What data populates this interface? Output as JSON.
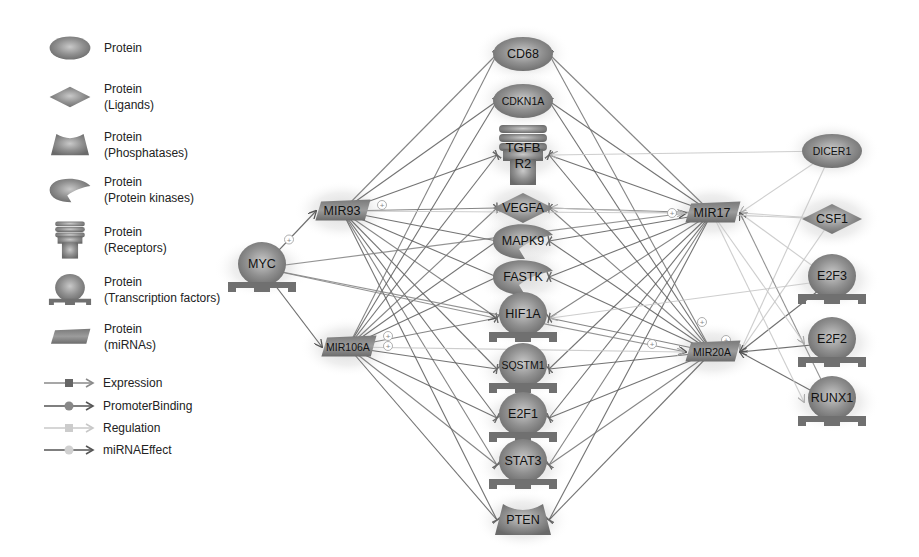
{
  "legend": {
    "node_types": [
      {
        "shape": "ellipse",
        "label_line1": "Protein",
        "label_line2": ""
      },
      {
        "shape": "diamond",
        "label_line1": "Protein",
        "label_line2": "(Ligands)"
      },
      {
        "shape": "phosphatase",
        "label_line1": "Protein",
        "label_line2": "(Phosphatases)"
      },
      {
        "shape": "kinase",
        "label_line1": "Protein",
        "label_line2": "(Protein kinases)"
      },
      {
        "shape": "receptor",
        "label_line1": "Protein",
        "label_line2": "(Receptors)"
      },
      {
        "shape": "tf",
        "label_line1": "Protein",
        "label_line2": "(Transcription factors)"
      },
      {
        "shape": "mirna",
        "label_line1": "Protein",
        "label_line2": "(miRNAs)"
      }
    ],
    "edge_types": [
      {
        "label": "Expression",
        "color": "#8a8a8a",
        "marker": "square",
        "marker_color": "#666666"
      },
      {
        "label": "PromoterBinding",
        "color": "#555555",
        "marker": "circle",
        "marker_color": "#888888"
      },
      {
        "label": "Regulation",
        "color": "#c8c8c8",
        "marker": "square",
        "marker_color": "#cccccc"
      },
      {
        "label": "miRNAEffect",
        "color": "#555555",
        "marker": "circle",
        "marker_color": "#d0d0d0"
      }
    ]
  },
  "nodes": [
    {
      "id": "CD68",
      "label": "CD68",
      "shape": "ellipse",
      "x": 523,
      "y": 54
    },
    {
      "id": "CDKN1A",
      "label": "CDKN1A",
      "shape": "ellipse",
      "x": 523,
      "y": 101
    },
    {
      "id": "TGFBR2",
      "label": "TGFB",
      "label2": "R2",
      "shape": "receptor",
      "x": 523,
      "y": 155
    },
    {
      "id": "VEGFA",
      "label": "VEGFA",
      "shape": "diamond",
      "x": 523,
      "y": 208
    },
    {
      "id": "MAPK9",
      "label": "MAPK9",
      "shape": "kinase",
      "x": 523,
      "y": 241
    },
    {
      "id": "FASTK",
      "label": "FASTK",
      "shape": "kinase",
      "x": 523,
      "y": 277
    },
    {
      "id": "HIF1A",
      "label": "HIF1A",
      "shape": "tf",
      "x": 523,
      "y": 318
    },
    {
      "id": "SQSTM1",
      "label": "SQSTM1",
      "shape": "tf",
      "x": 523,
      "y": 369
    },
    {
      "id": "E2F1",
      "label": "E2F1",
      "shape": "tf",
      "x": 523,
      "y": 418
    },
    {
      "id": "STAT3",
      "label": "STAT3",
      "shape": "tf",
      "x": 523,
      "y": 465
    },
    {
      "id": "PTEN",
      "label": "PTEN",
      "shape": "phosphatase",
      "x": 523,
      "y": 520
    },
    {
      "id": "MYC",
      "label": "MYC",
      "shape": "tf",
      "x": 262,
      "y": 268
    },
    {
      "id": "MIR93",
      "label": "MIR93",
      "shape": "mirna",
      "x": 342,
      "y": 211
    },
    {
      "id": "MIR106A",
      "label": "MIR106A",
      "shape": "mirna",
      "x": 348,
      "y": 347
    },
    {
      "id": "MIR17",
      "label": "MIR17",
      "shape": "mirna",
      "x": 712,
      "y": 213
    },
    {
      "id": "MIR20A",
      "label": "MIR20A",
      "shape": "mirna",
      "x": 712,
      "y": 352
    },
    {
      "id": "DICER1",
      "label": "DICER1",
      "shape": "ellipse",
      "x": 832,
      "y": 151
    },
    {
      "id": "CSF1",
      "label": "CSF1",
      "shape": "diamond",
      "x": 832,
      "y": 219
    },
    {
      "id": "E2F3",
      "label": "E2F3",
      "shape": "tf",
      "x": 832,
      "y": 280
    },
    {
      "id": "E2F2",
      "label": "E2F2",
      "shape": "tf",
      "x": 832,
      "y": 343
    },
    {
      "id": "RUNX1",
      "label": "RUNX1",
      "shape": "tf",
      "x": 832,
      "y": 402
    }
  ],
  "edges": {
    "mirna_targets_sources": [
      "MIR93",
      "MIR106A",
      "MIR17",
      "MIR20A"
    ],
    "mirna_targets": [
      "CD68",
      "CDKN1A",
      "TGFBR2",
      "VEGFA",
      "MAPK9",
      "FASTK",
      "HIF1A",
      "SQSTM1",
      "E2F1",
      "STAT3",
      "PTEN"
    ],
    "myc_edges": [
      {
        "from": "MYC",
        "to": "MIR93",
        "type": "PromoterBinding",
        "plus": true
      },
      {
        "from": "MYC",
        "to": "MIR106A",
        "type": "PromoterBinding",
        "plus": false
      },
      {
        "from": "MYC",
        "to": "MIR17",
        "type": "Expression",
        "plus": false
      },
      {
        "from": "MYC",
        "to": "MIR20A",
        "type": "Expression",
        "plus": false
      }
    ],
    "right_edges": [
      {
        "from": "DICER1",
        "to": "MIR17",
        "type": "Regulation"
      },
      {
        "from": "DICER1",
        "to": "MIR20A",
        "type": "Regulation"
      },
      {
        "from": "CSF1",
        "to": "MIR17",
        "type": "Regulation"
      },
      {
        "from": "CSF1",
        "to": "MIR20A",
        "type": "Regulation"
      },
      {
        "from": "E2F3",
        "to": "MIR20A",
        "type": "PromoterBinding"
      },
      {
        "from": "E2F3",
        "to": "MIR17",
        "type": "Regulation"
      },
      {
        "from": "E2F2",
        "to": "MIR20A",
        "type": "PromoterBinding"
      },
      {
        "from": "RUNX1",
        "to": "MIR20A",
        "type": "PromoterBinding"
      },
      {
        "from": "RUNX1",
        "to": "MIR17",
        "type": "Expression"
      },
      {
        "from": "MIR17",
        "to": "E2F2",
        "type": "Regulation"
      },
      {
        "from": "MIR17",
        "to": "RUNX1",
        "type": "Regulation"
      }
    ],
    "cross_edges": [
      {
        "from": "MIR93",
        "to": "MIR17",
        "type": "Regulation"
      },
      {
        "from": "MIR106A",
        "to": "MIR20A",
        "type": "Regulation"
      },
      {
        "from": "MYC",
        "to": "HIF1A",
        "type": "Expression"
      },
      {
        "from": "DICER1",
        "to": "TGFBR2",
        "type": "Regulation"
      },
      {
        "from": "E2F3",
        "to": "HIF1A",
        "type": "Regulation"
      },
      {
        "from": "CSF1",
        "to": "VEGFA",
        "type": "Regulation"
      }
    ]
  },
  "colors": {
    "node_fill_dark": "#6e6e6e",
    "node_fill_mid": "#9a9a9a",
    "node_fill_light": "#c9c9c9",
    "edge_dark": "#555555",
    "edge_mid": "#808080",
    "edge_light": "#c4c4c4",
    "text": "#111111",
    "halo": "#d8d8d8"
  }
}
